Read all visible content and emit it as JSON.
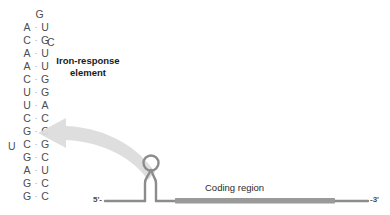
{
  "figure": {
    "ire_label_line1": "Iron-response",
    "ire_label_line2": "element",
    "coding_region_label": "Coding region",
    "five_prime_label": "5'-",
    "three_prime_label": "-3'",
    "bond_symbol": "·"
  },
  "colors": {
    "base_text": "#4d4d4d",
    "label_text": "#1a1a1a",
    "rna_backbone": "#8c8c8c",
    "coding_region_bar": "#9a9a9a",
    "arrow_fill": "#d9d9d9"
  },
  "stem": {
    "description": "RNA stem-loop base pairs, 5' strand on the left column, 3' strand on the right column",
    "pairs": [
      {
        "left": "",
        "right": "",
        "bonded": false,
        "top": 8,
        "loop_apex": "G"
      },
      {
        "left": "A",
        "right": "U",
        "bonded": true,
        "top": 21
      },
      {
        "left": "C",
        "right": "G",
        "bonded": true,
        "top": 34
      },
      {
        "left": "A",
        "right": "U",
        "bonded": true,
        "top": 47
      },
      {
        "left": "A",
        "right": "U",
        "bonded": true,
        "top": 60
      },
      {
        "left": "C",
        "right": "G",
        "bonded": true,
        "top": 73
      },
      {
        "left": "U",
        "right": "G",
        "bonded": true,
        "top": 86
      },
      {
        "left": "U",
        "right": "A",
        "bonded": true,
        "top": 99
      },
      {
        "left": "C",
        "right": "C",
        "bonded": true,
        "top": 112
      },
      {
        "left": "G",
        "right": "C",
        "bonded": true,
        "top": 125
      },
      {
        "left": "C",
        "right": "G",
        "bonded": true,
        "top": 138
      },
      {
        "left": "G",
        "right": "C",
        "bonded": true,
        "top": 151
      },
      {
        "left": "A",
        "right": "U",
        "bonded": true,
        "top": 164
      },
      {
        "left": "G",
        "right": "C",
        "bonded": true,
        "top": 177
      },
      {
        "left": "G",
        "right": "C",
        "bonded": true,
        "top": 190
      }
    ],
    "loop_apex_base": "G",
    "bulges": [
      {
        "base": "C",
        "side": "right",
        "left_px": 47,
        "top_px": 40
      },
      {
        "base": "U",
        "side": "left",
        "left_px": 8,
        "top_px": 143
      }
    ]
  }
}
